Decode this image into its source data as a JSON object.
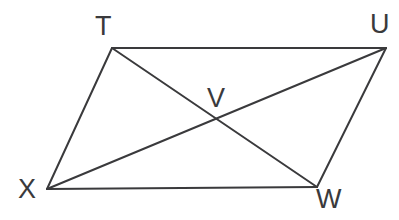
{
  "figure": {
    "kind": "geometry-diagram",
    "background_color": "#ffffff",
    "stroke_color": "#3a3a3c",
    "stroke_width": 2,
    "label_color": "#3a3a3c",
    "label_font_size": 27,
    "vertices": [
      {
        "id": "T",
        "label": "T",
        "x": 112,
        "y": 48,
        "label_x": 95,
        "label_y": 13
      },
      {
        "id": "U",
        "label": "U",
        "x": 386,
        "y": 48,
        "label_x": 370,
        "label_y": 11
      },
      {
        "id": "W",
        "label": "W",
        "x": 317,
        "y": 187,
        "label_x": 316,
        "label_y": 186
      },
      {
        "id": "X",
        "label": "X",
        "x": 47,
        "y": 189,
        "label_x": 18,
        "label_y": 176
      },
      {
        "id": "V",
        "label": "V",
        "x": 215,
        "y": 118,
        "label_x": 207,
        "label_y": 85
      }
    ],
    "sides": [
      {
        "name": "TU",
        "from": "T",
        "to": "U"
      },
      {
        "name": "UW",
        "from": "U",
        "to": "W"
      },
      {
        "name": "WX",
        "from": "W",
        "to": "X"
      },
      {
        "name": "XT",
        "from": "X",
        "to": "T"
      }
    ],
    "diagonals": [
      {
        "name": "TW",
        "from": "T",
        "to": "W"
      },
      {
        "name": "UX",
        "from": "U",
        "to": "X"
      }
    ]
  }
}
